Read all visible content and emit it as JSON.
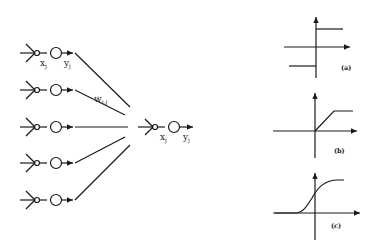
{
  "network": {
    "input_units": 5,
    "labels": {
      "unit_input": "x",
      "unit_input_sub": "j",
      "unit_output": "y",
      "unit_output_sub": "j",
      "weight": "w",
      "weight_sub": "i,j",
      "target_input": "x",
      "target_input_sub": "j",
      "target_output": "y",
      "target_output_sub": "j"
    }
  },
  "activation_functions": [
    {
      "id": "a",
      "caption": "(a)",
      "type": "step"
    },
    {
      "id": "b",
      "caption": "(b)",
      "type": "linear-threshold"
    },
    {
      "id": "c",
      "caption": "(c)",
      "type": "sigmoid"
    }
  ],
  "colors": {
    "ink": "#1a1a1a",
    "background": "#ffffff"
  }
}
